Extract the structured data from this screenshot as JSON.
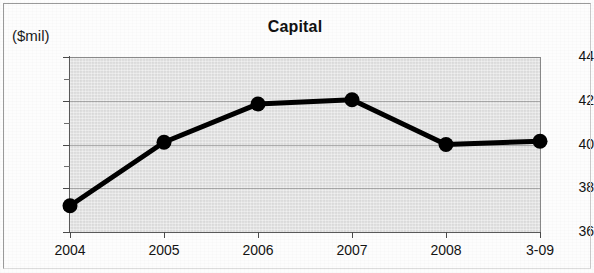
{
  "chart_data": {
    "type": "line",
    "title": "Capital",
    "unit_label": "($mil)",
    "xlabel": "",
    "ylabel": "",
    "categories": [
      "2004",
      "2005",
      "2006",
      "2007",
      "2008",
      "3-09"
    ],
    "values": [
      37.2,
      40.1,
      41.85,
      42.05,
      40.0,
      40.15
    ],
    "series": [
      {
        "name": "Capital",
        "values": [
          37.2,
          40.1,
          41.85,
          42.05,
          40.0,
          40.15
        ]
      }
    ],
    "ylim": [
      36,
      44
    ],
    "ytick_labels": [
      "36",
      "38",
      "40",
      "42",
      "44"
    ],
    "ytick_values": [
      36,
      38,
      40,
      42,
      44
    ],
    "yminor_values": [
      37,
      39,
      41,
      43
    ],
    "grid": true,
    "grid_values": [
      38,
      40,
      42
    ],
    "legend": "none",
    "line_color": "#000000",
    "marker_color": "#000000",
    "plot_background": "#dedede"
  },
  "axes": {
    "y_unit": "($mil)",
    "y_labels": [
      "44",
      "42",
      "40",
      "38",
      "36"
    ],
    "x_labels": [
      "2004",
      "2005",
      "2006",
      "2007",
      "2008",
      "3-09"
    ]
  },
  "title": {
    "text": "Capital"
  }
}
